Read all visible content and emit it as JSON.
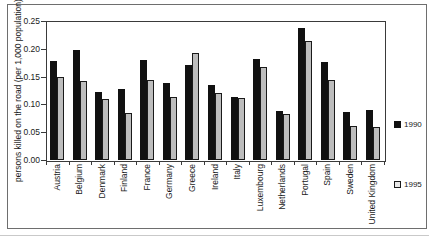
{
  "chart": {
    "frame_color": "#6e6e6e",
    "axis_color": "#3a3a3a",
    "text_color": "#1a1a1a",
    "background": "#ffffff"
  },
  "legend": {
    "items": [
      {
        "label": "1990",
        "marker_fill": "#111111",
        "marker_border": "#111111"
      },
      {
        "label": "1995",
        "marker_fill": "#e8e8e8",
        "marker_border": "#1a1a1a"
      }
    ]
  },
  "chart_data": {
    "type": "bar",
    "title": "",
    "xlabel": "",
    "ylabel": "persons killed on the road (per 1,000 population)",
    "ylim": [
      0,
      0.25
    ],
    "ytick_step": 0.05,
    "ytick_labels": [
      "0.00",
      "0.05",
      "0.10",
      "0.15",
      "0.20",
      "0.25"
    ],
    "grid": false,
    "legend_position": "right-outside",
    "categories": [
      "Austria",
      "Belgium",
      "Denmark",
      "Finland",
      "France",
      "Germany",
      "Greece",
      "Ireland",
      "Italy",
      "Luxembourg",
      "Netherlands",
      "Portugal",
      "Spain",
      "Sweden",
      "United Kingdom"
    ],
    "series": [
      {
        "name": "1990",
        "color": "#111111",
        "values": [
          0.178,
          0.197,
          0.122,
          0.128,
          0.179,
          0.138,
          0.17,
          0.134,
          0.114,
          0.182,
          0.089,
          0.237,
          0.176,
          0.086,
          0.09
        ]
      },
      {
        "name": "1995",
        "color": "#bdbdbd",
        "values": [
          0.15,
          0.142,
          0.11,
          0.085,
          0.143,
          0.113,
          0.192,
          0.121,
          0.112,
          0.168,
          0.083,
          0.214,
          0.143,
          0.061,
          0.059
        ]
      }
    ]
  }
}
